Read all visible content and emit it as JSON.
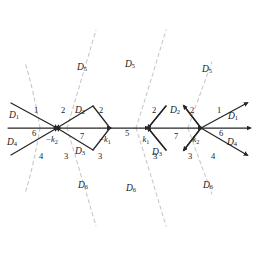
{
  "figure": {
    "type": "scattering-diagram",
    "background": "#ffffff",
    "edge_color": "#262626",
    "separatrix_color": "#c8c8c8",
    "width": 258,
    "height": 256
  },
  "regions": [
    {
      "id": "D5-left",
      "label": "D",
      "sub": "5",
      "x": 82,
      "y": 68
    },
    {
      "id": "D5-center",
      "label": "D",
      "sub": "5",
      "x": 130,
      "y": 65
    },
    {
      "id": "D5-right",
      "label": "D",
      "sub": "5",
      "x": 207,
      "y": 70
    },
    {
      "id": "D6-left",
      "label": "D",
      "sub": "6",
      "x": 83,
      "y": 186
    },
    {
      "id": "D6-center",
      "label": "D",
      "sub": "6",
      "x": 131,
      "y": 189
    },
    {
      "id": "D6-right",
      "label": "D",
      "sub": "6",
      "x": 208,
      "y": 186
    },
    {
      "id": "D1-left",
      "label": "D",
      "sub": "1",
      "x": 14,
      "y": 116
    },
    {
      "id": "D4-left",
      "label": "D",
      "sub": "4",
      "x": 12,
      "y": 143
    },
    {
      "id": "D1-right",
      "label": "D",
      "sub": "1",
      "x": 233,
      "y": 117
    },
    {
      "id": "D4-right",
      "label": "D",
      "sub": "4",
      "x": 232,
      "y": 143
    },
    {
      "id": "D2-left",
      "label": "D",
      "sub": "2",
      "x": 80,
      "y": 111
    },
    {
      "id": "D3-left",
      "label": "D",
      "sub": "3",
      "x": 80,
      "y": 152
    },
    {
      "id": "D2-right",
      "label": "D",
      "sub": "2",
      "x": 175,
      "y": 111
    },
    {
      "id": "D3-right",
      "label": "D",
      "sub": "3",
      "x": 157,
      "y": 153
    }
  ],
  "edge_numbers": [
    {
      "id": "n1-left",
      "text": "1",
      "x": 36,
      "y": 110
    },
    {
      "id": "n2-left",
      "text": "2",
      "x": 63,
      "y": 110
    },
    {
      "id": "n2-mid-l",
      "text": "2",
      "x": 101,
      "y": 110
    },
    {
      "id": "n6-left",
      "text": "6",
      "x": 34,
      "y": 133
    },
    {
      "id": "n4-left",
      "text": "4",
      "x": 41,
      "y": 156
    },
    {
      "id": "n3-left",
      "text": "3",
      "x": 66,
      "y": 156
    },
    {
      "id": "n3-mid-l",
      "text": "3",
      "x": 100,
      "y": 156
    },
    {
      "id": "n7-left",
      "text": "7",
      "x": 82,
      "y": 136
    },
    {
      "id": "n5-center",
      "text": "5",
      "x": 127,
      "y": 133
    },
    {
      "id": "n2-mid-r",
      "text": "2",
      "x": 154,
      "y": 110
    },
    {
      "id": "n2-right",
      "text": "2",
      "x": 192,
      "y": 110
    },
    {
      "id": "n1-right",
      "text": "1",
      "x": 219,
      "y": 110
    },
    {
      "id": "n7-right",
      "text": "7",
      "x": 176,
      "y": 136
    },
    {
      "id": "n3-mid-r",
      "text": "3",
      "x": 155,
      "y": 156
    },
    {
      "id": "n3-right",
      "text": "3",
      "x": 190,
      "y": 156
    },
    {
      "id": "n4-right",
      "text": "4",
      "x": 213,
      "y": 156
    },
    {
      "id": "n6-right",
      "text": "6",
      "x": 221,
      "y": 133
    }
  ],
  "vertex_labels": [
    {
      "id": "minus-k2",
      "neg": "−",
      "label": "k",
      "sub": "2",
      "x": 52,
      "y": 140
    },
    {
      "id": "minus-k1",
      "neg": "−",
      "label": "k",
      "sub": "1",
      "x": 105,
      "y": 140
    },
    {
      "id": "k1",
      "neg": "",
      "label": "k",
      "sub": "1",
      "x": 146,
      "y": 140
    },
    {
      "id": "k2",
      "neg": "",
      "label": "k",
      "sub": "2",
      "x": 196,
      "y": 140
    }
  ]
}
